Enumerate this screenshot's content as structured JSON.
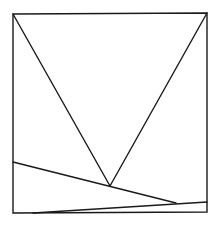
{
  "diagram": {
    "type": "geometric-figure",
    "stroke_color": "#1a1a1a",
    "background": "#ffffff",
    "square": {
      "x1": 13,
      "y1": 14,
      "x2": 207,
      "y2": 213
    },
    "points": {
      "top_left": [
        13,
        14
      ],
      "top_right": [
        207,
        13
      ],
      "bottom_left": [
        13,
        213
      ],
      "bottom_right": [
        207,
        212
      ],
      "apex": [
        110,
        186
      ],
      "left_side": [
        13,
        162
      ],
      "right_meet": [
        176,
        203
      ],
      "right_side": [
        207,
        202
      ],
      "bottom_start": [
        33,
        213
      ]
    },
    "segments": [
      {
        "name": "v-left-line",
        "from": "top_left",
        "to": "apex"
      },
      {
        "name": "v-right-line",
        "from": "top_right",
        "to": "apex"
      },
      {
        "name": "sloped-line",
        "from": "left_side",
        "to": "right_meet"
      },
      {
        "name": "lower-line",
        "from": "bottom_start",
        "to": "right_side"
      }
    ]
  }
}
